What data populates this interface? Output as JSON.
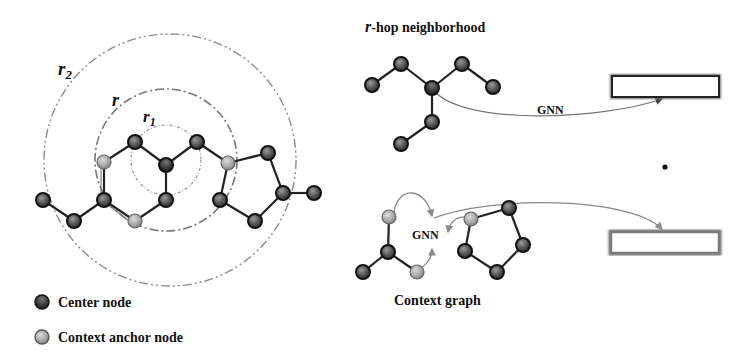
{
  "radii_labels": {
    "r2": {
      "base": "r",
      "sub": "2"
    },
    "r": {
      "base": "r"
    },
    "r1": {
      "base": "r",
      "sub": "1"
    }
  },
  "neighborhood": {
    "title_var": "r",
    "title_rest": "-hop neighborhood",
    "edge_label": "GNN"
  },
  "context": {
    "title": "Context graph",
    "edge_label": "GNN"
  },
  "legend": {
    "items": [
      {
        "label": "Center node",
        "type": "center"
      },
      {
        "label": "Context anchor node",
        "type": "anchor"
      }
    ]
  },
  "colors": {
    "center_node": "#4a4a4a",
    "anchor_node": "#a8a8a8",
    "edge": "#222222",
    "circle": "#8c8c8c",
    "arrow": "#8a8a8a"
  }
}
